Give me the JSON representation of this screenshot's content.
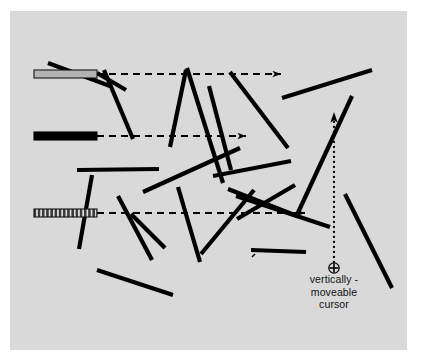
{
  "figure": {
    "name": "random-line-orientation-stimulus",
    "background_color": "#ffffff",
    "panel_color": "#d9d9d9",
    "ink_color": "#000000",
    "panel": {
      "x": 10,
      "y": 11,
      "width": 397,
      "height": 339
    }
  },
  "caption": {
    "line1": "vertically -",
    "line2": "moveable",
    "line3": "cursor"
  },
  "cursor": {
    "name": "circled-plus-cursor",
    "x": 334,
    "y": 268,
    "radius": 5.2,
    "glyph": "circled-plus"
  },
  "vertical_guide": {
    "name": "vertical-dotted-guide",
    "x": 334,
    "y_top": 112,
    "y_bottom": 262,
    "style": "dotted",
    "arrowhead": "up",
    "dot_radius": 1.15,
    "dot_spacing": 5.0
  },
  "reference_bars": [
    {
      "name": "bar-outlined-gray",
      "fill": "#b3b3b3",
      "stroke": "#151515",
      "pattern": "outlined",
      "x": 34,
      "y": 70,
      "width": 63,
      "height": 8
    },
    {
      "name": "bar-solid-black",
      "fill": "#000000",
      "stroke": "#000000",
      "pattern": "solid",
      "x": 34,
      "y": 132,
      "width": 63,
      "height": 8
    },
    {
      "name": "bar-striped",
      "fill": "#555555",
      "stroke": "#151515",
      "pattern": "vertical-stripes",
      "x": 34,
      "y": 209,
      "width": 63,
      "height": 8
    }
  ],
  "dashed_arrows": [
    {
      "name": "dashed-arrow-top",
      "x1": 97,
      "y1": 74,
      "x2": 281,
      "y2": 74
    },
    {
      "name": "dashed-arrow-middle",
      "x1": 97,
      "y1": 136,
      "x2": 246,
      "y2": 136
    },
    {
      "name": "dashed-arrow-bottom",
      "x1": 97,
      "y1": 213,
      "x2": 305,
      "y2": 213
    }
  ],
  "line_segments": [
    {
      "name": "segment-01",
      "x1": 48,
      "y1": 63,
      "x2": 110,
      "y2": 86
    },
    {
      "name": "segment-02",
      "x1": 97,
      "y1": 73,
      "x2": 126,
      "y2": 90
    },
    {
      "name": "segment-03",
      "x1": 104,
      "y1": 70,
      "x2": 133,
      "y2": 139
    },
    {
      "name": "segment-04",
      "x1": 186,
      "y1": 70,
      "x2": 170,
      "y2": 147
    },
    {
      "name": "segment-05",
      "x1": 187,
      "y1": 68,
      "x2": 223,
      "y2": 183
    },
    {
      "name": "segment-06",
      "x1": 209,
      "y1": 86,
      "x2": 231,
      "y2": 170
    },
    {
      "name": "segment-07",
      "x1": 230,
      "y1": 72,
      "x2": 288,
      "y2": 148
    },
    {
      "name": "segment-08",
      "x1": 282,
      "y1": 98,
      "x2": 372,
      "y2": 70
    },
    {
      "name": "segment-09",
      "x1": 77,
      "y1": 170,
      "x2": 159,
      "y2": 169
    },
    {
      "name": "segment-10",
      "x1": 143,
      "y1": 192,
      "x2": 240,
      "y2": 148
    },
    {
      "name": "segment-11",
      "x1": 213,
      "y1": 176,
      "x2": 291,
      "y2": 161
    },
    {
      "name": "segment-12",
      "x1": 296,
      "y1": 217,
      "x2": 352,
      "y2": 96
    },
    {
      "name": "segment-13",
      "x1": 92,
      "y1": 175,
      "x2": 79,
      "y2": 249
    },
    {
      "name": "segment-14",
      "x1": 118,
      "y1": 196,
      "x2": 152,
      "y2": 260
    },
    {
      "name": "segment-15",
      "x1": 131,
      "y1": 214,
      "x2": 165,
      "y2": 248
    },
    {
      "name": "segment-16",
      "x1": 178,
      "y1": 187,
      "x2": 200,
      "y2": 262
    },
    {
      "name": "segment-17",
      "x1": 228,
      "y1": 189,
      "x2": 297,
      "y2": 216
    },
    {
      "name": "segment-18",
      "x1": 295,
      "y1": 185,
      "x2": 237,
      "y2": 219
    },
    {
      "name": "segment-19",
      "x1": 236,
      "y1": 196,
      "x2": 330,
      "y2": 227
    },
    {
      "name": "segment-20",
      "x1": 345,
      "y1": 194,
      "x2": 392,
      "y2": 288
    },
    {
      "name": "segment-21",
      "x1": 97,
      "y1": 270,
      "x2": 173,
      "y2": 295
    },
    {
      "name": "segment-22",
      "x1": 253,
      "y1": 255,
      "x2": 254,
      "y2": 256
    },
    {
      "name": "segment-23",
      "x1": 251,
      "y1": 250,
      "x2": 306,
      "y2": 252
    },
    {
      "name": "segment-24",
      "x1": 254,
      "y1": 190,
      "x2": 201,
      "y2": 254
    }
  ],
  "line_style": {
    "stroke_width": 4.2,
    "dash_pattern": "7 5",
    "dash_width": 1.8
  }
}
